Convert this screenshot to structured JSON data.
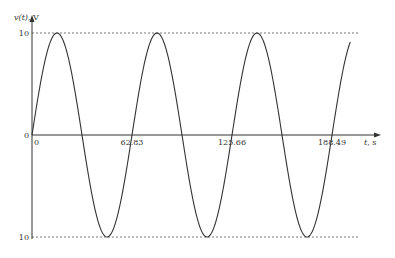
{
  "chart_data": {
    "type": "line",
    "title": "",
    "ylabel_var": "v(t)",
    "ylabel_unit": ", V",
    "xlabel_var": "t",
    "xlabel_unit": ", s",
    "function": "v(t) = 10 sin(0.1 t)",
    "amplitude": 10,
    "angular_frequency": 0.1,
    "xlim": [
      0,
      200
    ],
    "ylim": [
      -10,
      10
    ],
    "x_ticks": [
      {
        "value": 0,
        "label": "0"
      },
      {
        "value": 62.83,
        "label": "62.83"
      },
      {
        "value": 125.66,
        "label": "125.66"
      },
      {
        "value": 188.49,
        "label": "188.49"
      }
    ],
    "y_ticks": [
      {
        "value": 10,
        "label": "10"
      },
      {
        "value": 0,
        "label": "0"
      },
      {
        "value": -10,
        "label": "10"
      }
    ],
    "reference_lines": [
      {
        "value": 10,
        "style": "dashed"
      },
      {
        "value": -10,
        "style": "dashed"
      }
    ],
    "series": [
      {
        "name": "v(t)",
        "color": "#333333"
      }
    ],
    "grid": false,
    "legend": "none"
  }
}
